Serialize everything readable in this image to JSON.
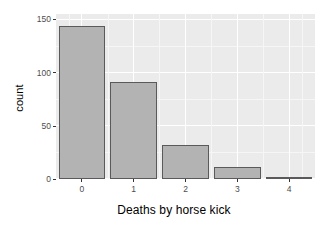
{
  "chart_data": {
    "type": "bar",
    "title": "",
    "subtitle": "",
    "xlabel": "Deaths by horse kick",
    "ylabel": "count",
    "categories": [
      "0",
      "1",
      "2",
      "3",
      "4"
    ],
    "values": [
      144,
      91,
      32,
      11,
      2
    ],
    "series": [
      {
        "name": "count",
        "values": [
          144,
          91,
          32,
          11,
          2
        ]
      }
    ],
    "xlim": [
      -0.5,
      4.5
    ],
    "ylim": [
      0,
      155
    ],
    "y_ticks": [
      0,
      50,
      100,
      150
    ],
    "y_tick_labels": [
      "0",
      "50",
      "100",
      "150"
    ],
    "y_minor_ticks": [
      25,
      75,
      125
    ],
    "x_ticks": [
      0,
      1,
      2,
      3,
      4
    ],
    "x_tick_labels": [
      "0",
      "1",
      "2",
      "3",
      "4"
    ],
    "grid": true,
    "legend": null,
    "legend_position": "none",
    "annotations": [],
    "style": {
      "panel_background": "#ebebeb",
      "plot_background": "#ffffff",
      "major_gridline_color": "#ffffff",
      "minor_gridline_color": "#f6f6f6",
      "bar_fill": "#b3b3b3",
      "bar_border": "#5a5a5a",
      "axis_text_color": "#4d4d4d",
      "axis_title_color": "#000000",
      "tick_mark_color": "#333333"
    }
  },
  "axes": {
    "y_title": "count",
    "x_title": "Deaths by horse kick"
  }
}
